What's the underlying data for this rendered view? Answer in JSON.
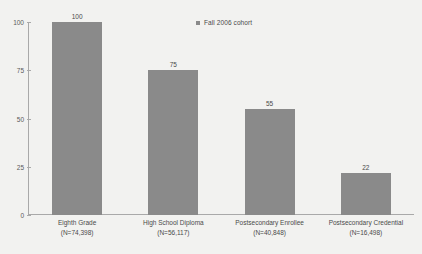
{
  "legend": {
    "marker": "square-marker-icon",
    "label": "Fall 2006 cohort",
    "color": "#8a8a8a"
  },
  "axes": {
    "y_ticks": [
      "0",
      "25",
      "50",
      "75",
      "100"
    ],
    "x_label": "",
    "y_label": ""
  },
  "chart_data": {
    "type": "bar",
    "title": "",
    "xlabel": "",
    "ylabel": "",
    "ylim": [
      0,
      100
    ],
    "yticks": [
      0,
      25,
      50,
      75,
      100
    ],
    "grid": false,
    "legend_position": "top-center",
    "series": [
      {
        "name": "Fall 2006 cohort",
        "color": "#8a8a8a",
        "values": [
          100,
          75,
          55,
          22
        ]
      }
    ],
    "categories": [
      "Eighth Grade",
      "High School Diploma",
      "Postsecondary Enrollee",
      "Postsecondary Credential"
    ],
    "category_counts": [
      "(N=74,398)",
      "(N=56,117)",
      "(N=40,848)",
      "(N=16,498)"
    ],
    "data_labels": [
      "100",
      "75",
      "55",
      "22"
    ]
  },
  "bars": [
    {
      "name": "Eighth Grade",
      "count": "(N=74,398)",
      "value_label": "100",
      "value": 100
    },
    {
      "name": "High School Diploma",
      "count": "(N=56,117)",
      "value_label": "75",
      "value": 75
    },
    {
      "name": "Postsecondary Enrollee",
      "count": "(N=40,848)",
      "value_label": "55",
      "value": 55
    },
    {
      "name": "Postsecondary Credential",
      "count": "(N=16,498)",
      "value_label": "22",
      "value": 22
    }
  ]
}
